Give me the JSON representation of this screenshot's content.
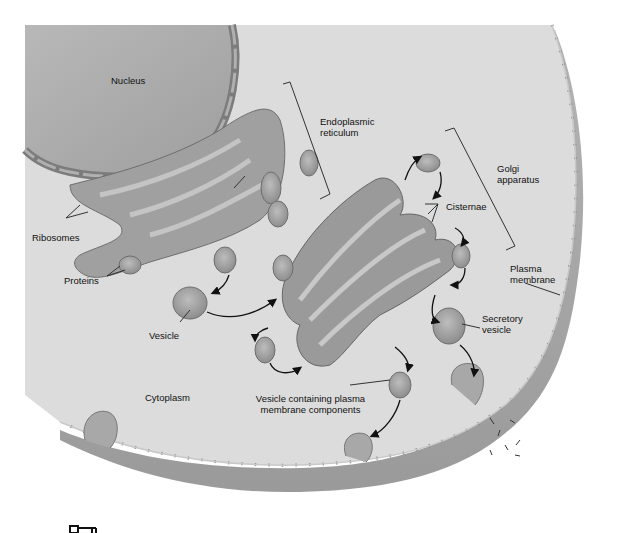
{
  "diagram": {
    "type": "biology-cell-secretory-pathway",
    "colors": {
      "background": "#ffffff",
      "cytoplasm": "#dcdcdc",
      "nucleus": "#a9a9a9",
      "organelle": "#9a9a9a",
      "extracellular_band": "#a6a6a6",
      "line": "#222222"
    },
    "labels": {
      "nucleus": "Nucleus",
      "endoplasmic_reticulum": [
        "Endoplasmic",
        "reticulum"
      ],
      "golgi_apparatus": [
        "Golgi",
        "apparatus"
      ],
      "cisternae": "Cisternae",
      "ribosomes": "Ribosomes",
      "proteins": "Proteins",
      "plasma_membrane": [
        "Plasma",
        "membrane"
      ],
      "vesicle": "Vesicle",
      "secretory_vesicle": [
        "Secretory",
        "vesicle"
      ],
      "cytoplasm": "Cytoplasm",
      "vesicle_plasma_membrane": [
        "Vesicle containing plasma",
        "membrane components"
      ]
    },
    "icons": {
      "key_icon": "key-icon"
    }
  }
}
